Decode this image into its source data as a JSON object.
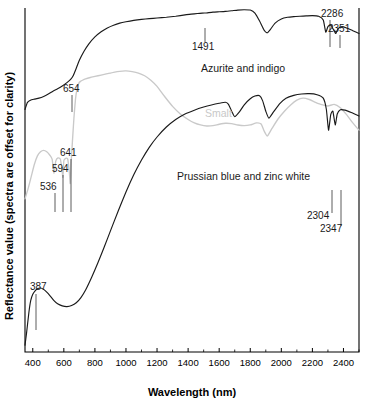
{
  "chart_data": {
    "type": "line",
    "title": "",
    "subtitle": "",
    "xlabel": "Wavelength (nm)",
    "ylabel": "Reflectance value (spectra are offset for clarity)",
    "xlim": [
      350,
      2500
    ],
    "ylim": [
      0,
      100
    ],
    "grid": false,
    "legend_position": "inline-annotations",
    "xticks": [
      400,
      600,
      800,
      1000,
      1200,
      1400,
      1600,
      1800,
      2000,
      2200,
      2400
    ],
    "xtick_labels": [
      "400",
      "600",
      "800",
      "1000",
      "1200",
      "1400",
      "1600",
      "1800",
      "2000",
      "2200",
      "2400"
    ],
    "yticks": [],
    "ytick_labels": [],
    "series": [
      {
        "name": "Azurite and indigo",
        "color": "#1a1a1a",
        "x": [
          350,
          365,
          385,
          410,
          440,
          470,
          500,
          530,
          560,
          590,
          620,
          645,
          660,
          680,
          700,
          730,
          760,
          800,
          840,
          880,
          920,
          960,
          1000,
          1050,
          1100,
          1150,
          1200,
          1260,
          1320,
          1380,
          1420,
          1460,
          1491,
          1520,
          1560,
          1600,
          1640,
          1680,
          1720,
          1760,
          1800,
          1830,
          1860,
          1890,
          1910,
          1930,
          1960,
          2000,
          2040,
          2080,
          2120,
          2160,
          2200,
          2240,
          2270,
          2286,
          2300,
          2320,
          2340,
          2351,
          2365,
          2390,
          2420,
          2460,
          2500
        ],
        "y": [
          70.5,
          72.5,
          73.2,
          73.5,
          73.8,
          74.3,
          75.0,
          75.8,
          76.5,
          77.3,
          78.3,
          79.3,
          80.3,
          82.5,
          84.8,
          87.4,
          89.5,
          91.6,
          93.1,
          94.2,
          95.0,
          95.6,
          96.0,
          96.4,
          96.7,
          96.9,
          97.1,
          97.3,
          97.6,
          98.0,
          98.2,
          98.4,
          98.5,
          98.6,
          98.8,
          98.9,
          99.0,
          99.2,
          99.4,
          99.5,
          99.4,
          98.5,
          96.2,
          93.5,
          92.8,
          93.8,
          95.6,
          96.8,
          97.3,
          97.5,
          97.6,
          97.7,
          97.8,
          97.6,
          96.5,
          93.0,
          94.6,
          95.0,
          93.3,
          92.6,
          94.0,
          94.6,
          94.2,
          93.4,
          92.6
        ]
      },
      {
        "name": "Smalt",
        "color": "#c9c9c9",
        "x": [
          350,
          370,
          390,
          410,
          430,
          450,
          470,
          490,
          510,
          525,
          536,
          548,
          562,
          578,
          590,
          594,
          600,
          612,
          625,
          636,
          641,
          647,
          655,
          665,
          675,
          685,
          695,
          705,
          720,
          740,
          770,
          800,
          840,
          880,
          920,
          960,
          1000,
          1040,
          1080,
          1120,
          1160,
          1200,
          1250,
          1300,
          1350,
          1400,
          1440,
          1480,
          1520,
          1560,
          1600,
          1640,
          1680,
          1720,
          1760,
          1800,
          1840,
          1870,
          1890,
          1910,
          1940,
          1980,
          2020,
          2060,
          2100,
          2140,
          2180,
          2220,
          2260,
          2300,
          2340,
          2380,
          2420,
          2460,
          2500
        ],
        "y": [
          44.5,
          47.5,
          51.0,
          54.5,
          57.0,
          58.2,
          58.6,
          58.2,
          57.2,
          56.0,
          52.0,
          55.5,
          56.4,
          56.0,
          52.3,
          50.8,
          55.6,
          56.3,
          56.1,
          52.0,
          49.0,
          55.0,
          61.0,
          68.0,
          73.5,
          76.5,
          78.0,
          78.6,
          79.0,
          79.4,
          79.8,
          80.1,
          80.5,
          80.9,
          81.3,
          81.6,
          81.7,
          81.5,
          81.1,
          80.3,
          79.0,
          77.2,
          74.2,
          71.4,
          69.2,
          67.6,
          66.6,
          66.0,
          65.7,
          65.8,
          66.2,
          66.5,
          66.4,
          66.0,
          65.8,
          66.0,
          66.6,
          66.3,
          64.2,
          62.8,
          65.0,
          67.8,
          70.0,
          71.8,
          73.2,
          73.8,
          73.4,
          72.6,
          71.9,
          71.5,
          72.0,
          71.0,
          69.0,
          66.6,
          64.5
        ]
      },
      {
        "name": "Prussian blue and zinc white",
        "color": "#1a1a1a",
        "x": [
          350,
          360,
          375,
          387,
          400,
          415,
          430,
          450,
          470,
          490,
          510,
          535,
          560,
          590,
          620,
          650,
          680,
          710,
          740,
          780,
          820,
          860,
          900,
          950,
          1000,
          1050,
          1100,
          1150,
          1200,
          1260,
          1320,
          1380,
          1440,
          1500,
          1550,
          1600,
          1640,
          1660,
          1680,
          1700,
          1730,
          1760,
          1800,
          1830,
          1860,
          1880,
          1900,
          1920,
          1950,
          1990,
          2030,
          2080,
          2130,
          2180,
          2230,
          2270,
          2290,
          2304,
          2318,
          2332,
          2347,
          2360,
          2380,
          2410,
          2450,
          2500
        ],
        "y": [
          2.0,
          5.5,
          11.5,
          15.0,
          16.8,
          17.8,
          18.4,
          18.6,
          18.2,
          17.4,
          16.4,
          15.0,
          14.0,
          13.4,
          13.2,
          13.5,
          14.3,
          15.8,
          18.0,
          21.8,
          26.0,
          30.5,
          35.2,
          41.0,
          46.5,
          51.5,
          55.8,
          59.5,
          62.5,
          65.4,
          67.6,
          69.2,
          70.3,
          71.2,
          71.8,
          72.3,
          72.6,
          72.0,
          70.0,
          68.4,
          69.8,
          71.8,
          73.6,
          74.4,
          74.5,
          73.0,
          70.0,
          68.0,
          69.8,
          72.2,
          73.8,
          74.6,
          75.0,
          75.1,
          74.8,
          73.8,
          70.5,
          64.5,
          69.0,
          70.0,
          66.0,
          69.2,
          70.4,
          70.3,
          69.6,
          68.6
        ]
      }
    ],
    "annotations": [
      {
        "id": "ann-387",
        "label": "387",
        "series": "Prussian blue and zinc white",
        "x_nm": 387,
        "label_x": 30,
        "label_y": 290,
        "line_x": 36,
        "line_y1": 294,
        "line_y2": 330
      },
      {
        "id": "ann-536",
        "label": "536",
        "series": "Smalt",
        "x_nm": 536,
        "label_x": 40,
        "label_y": 190,
        "line_x": 55,
        "line_y1": 193,
        "line_y2": 212
      },
      {
        "id": "ann-594",
        "label": "594",
        "series": "Smalt",
        "x_nm": 594,
        "label_x": 52,
        "label_y": 172,
        "line_x": 63,
        "line_y1": 175,
        "line_y2": 212
      },
      {
        "id": "ann-641",
        "label": "641",
        "series": "Smalt",
        "x_nm": 641,
        "label_x": 60,
        "label_y": 156,
        "line_x": 71,
        "line_y1": 159,
        "line_y2": 212
      },
      {
        "id": "ann-654",
        "label": "654",
        "series": "Azurite and indigo",
        "x_nm": 654,
        "label_x": 63,
        "label_y": 92,
        "line_x": 72,
        "line_y1": 95,
        "line_y2": 112
      },
      {
        "id": "ann-1491",
        "label": "1491",
        "series": "Azurite and indigo",
        "x_nm": 1491,
        "label_x": 192,
        "label_y": 50,
        "line_x": 205,
        "line_y1": 28,
        "line_y2": 42
      },
      {
        "id": "ann-2286",
        "label": "2286",
        "series": "Azurite and indigo",
        "x_nm": 2286,
        "label_x": 321,
        "label_y": 17,
        "line_x": 330,
        "line_y1": 20,
        "line_y2": 47
      },
      {
        "id": "ann-2351",
        "label": "2351",
        "series": "Azurite and indigo",
        "x_nm": 2351,
        "label_x": 328,
        "label_y": 32,
        "line_x": 340,
        "line_y1": 35,
        "line_y2": 48
      },
      {
        "id": "ann-2304",
        "label": "2304",
        "series": "Prussian blue and zinc white",
        "x_nm": 2304,
        "label_x": 307,
        "label_y": 219,
        "line_x": 332,
        "line_y1": 190,
        "line_y2": 213
      },
      {
        "id": "ann-2347",
        "label": "2347",
        "series": "Prussian blue and zinc white",
        "x_nm": 2347,
        "label_x": 320,
        "label_y": 232,
        "line_x": 341,
        "line_y1": 190,
        "line_y2": 226
      }
    ],
    "series_labels": [
      {
        "id": "label-azurite",
        "text": "Azurite and indigo",
        "x": 201,
        "y": 72,
        "color": "#1a1a1a"
      },
      {
        "id": "label-smalt",
        "text": "Smalt",
        "x": 205,
        "y": 117,
        "color": "#c9c9c9"
      },
      {
        "id": "label-prussian",
        "text": "Prussian blue and zinc white",
        "x": 177,
        "y": 180,
        "color": "#1a1a1a"
      }
    ]
  }
}
